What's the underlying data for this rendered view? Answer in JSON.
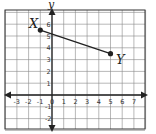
{
  "figure": {
    "axis_labels": {
      "x": "",
      "y": "y"
    },
    "x_ticks": [
      "-3",
      "-2",
      "-1",
      "0",
      "1",
      "2",
      "3",
      "4",
      "5",
      "6",
      "7"
    ],
    "y_ticks": [
      "1",
      "2",
      "3",
      "4",
      "5",
      "6",
      "-1",
      "-2"
    ],
    "grid": {
      "xmin": -4,
      "xmax": 8,
      "ymin": -3,
      "ymax": 7
    },
    "points": [
      {
        "label": "X",
        "x": -1,
        "y": 5.5
      },
      {
        "label": "Y",
        "x": 5,
        "y": 3.5
      }
    ],
    "segment": {
      "from": "X",
      "to": "Y"
    }
  },
  "chart_data": {
    "type": "line",
    "title": "",
    "xlabel": "",
    "ylabel": "y",
    "xlim": [
      -4,
      8
    ],
    "ylim": [
      -3,
      7
    ],
    "grid": true,
    "series": [
      {
        "name": "segment XY",
        "x": [
          -1,
          5
        ],
        "y": [
          5.5,
          3.5
        ],
        "labels": [
          "X",
          "Y"
        ]
      }
    ]
  }
}
